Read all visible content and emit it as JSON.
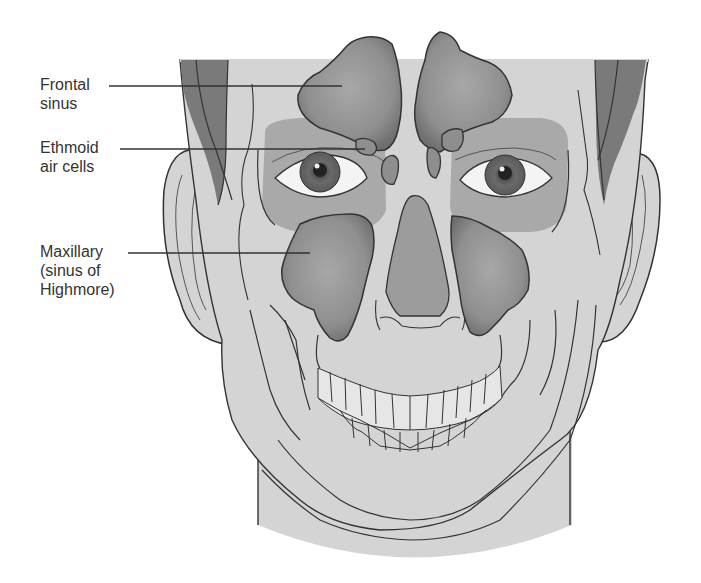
{
  "figure": {
    "colors": {
      "background": "#ffffff",
      "skin": "#d4d4d4",
      "skin_light": "#dcdcdc",
      "hair": "#7a7a7a",
      "orbit": "#a9a9a9",
      "sinus_fill": "#8e8e8e",
      "sinus_highlight": "#a6a6a6",
      "nose_cavity": "#9c9c9c",
      "outline": "#333333",
      "leader_line": "#333333",
      "eye_white": "#f4f4f4",
      "iris": "#6e6e6e",
      "pupil": "#222222",
      "teeth": "#e6e6e6"
    }
  },
  "labels": [
    {
      "id": "frontal",
      "lines": [
        "Frontal",
        "sinus"
      ]
    },
    {
      "id": "ethmoid",
      "lines": [
        "Ethmoid",
        "air cells"
      ]
    },
    {
      "id": "maxillary",
      "lines": [
        "Maxillary",
        "(sinus of",
        "Highmore)"
      ]
    }
  ]
}
